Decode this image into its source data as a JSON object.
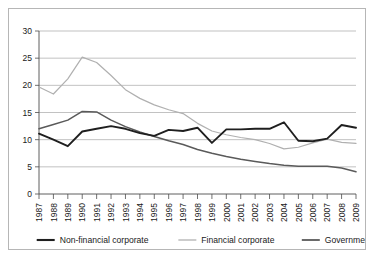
{
  "chart_data": {
    "type": "line",
    "title": "",
    "subtitle": "",
    "xlabel": "",
    "ylabel": "",
    "xlim": [
      1987,
      2009
    ],
    "ylim": [
      0,
      30
    ],
    "yticks": [
      0,
      5,
      10,
      15,
      20,
      25,
      30
    ],
    "grid": true,
    "legend_position": "bottom",
    "x": [
      1987,
      1988,
      1989,
      1990,
      1991,
      1992,
      1993,
      1994,
      1995,
      1996,
      1997,
      1998,
      1999,
      2000,
      2001,
      2002,
      2003,
      2004,
      2005,
      2006,
      2007,
      2008,
      2009
    ],
    "categories": [
      "1987",
      "1988",
      "1989",
      "1990",
      "1991",
      "1992",
      "1993",
      "1994",
      "1995",
      "1996",
      "1997",
      "1998",
      "1999",
      "2000",
      "2001",
      "2002",
      "2003",
      "2004",
      "2005",
      "2006",
      "2007",
      "2008",
      "2009"
    ],
    "series": [
      {
        "name": "Non-financial corporate",
        "color": "#1f1f1f",
        "width": 1.9,
        "values": [
          11.1,
          10.0,
          8.8,
          11.5,
          12.0,
          12.5,
          12.0,
          11.2,
          10.7,
          11.8,
          11.6,
          12.2,
          9.4,
          11.9,
          11.9,
          12.0,
          12.0,
          13.2,
          9.8,
          9.7,
          10.2,
          12.7,
          12.2
        ]
      },
      {
        "name": "Financial corporate",
        "color": "#b0b0b0",
        "width": 1.2,
        "values": [
          19.7,
          18.4,
          21.2,
          25.2,
          24.2,
          21.8,
          19.2,
          17.6,
          16.4,
          15.5,
          14.8,
          13.0,
          11.6,
          10.9,
          10.4,
          10.0,
          9.3,
          8.3,
          8.6,
          9.4,
          10.1,
          9.5,
          9.3
        ]
      },
      {
        "name": "Government",
        "color": "#5a5a5a",
        "width": 1.5,
        "values": [
          12.0,
          12.8,
          13.6,
          15.2,
          15.1,
          13.6,
          12.4,
          11.4,
          10.6,
          9.8,
          9.1,
          8.2,
          7.5,
          6.9,
          6.4,
          6.0,
          5.6,
          5.3,
          5.1,
          5.1,
          5.1,
          4.8,
          4.1
        ]
      }
    ],
    "legend": [
      {
        "label": "Non-financial corporate",
        "color": "#1f1f1f",
        "width": 2.1
      },
      {
        "label": "Financial corporate",
        "color": "#b0b0b0",
        "width": 1.3
      },
      {
        "label": "Government",
        "color": "#5a5a5a",
        "width": 1.8
      }
    ]
  },
  "colors": {
    "background": "#ffffff",
    "frame_border": "#b6b6b6",
    "gridline": "#a8a8a8",
    "axis": "#4d4d4d",
    "text": "#1a1a1a"
  }
}
